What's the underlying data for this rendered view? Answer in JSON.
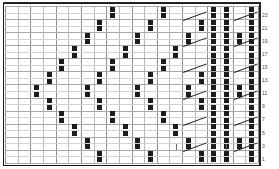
{
  "chart_data": {
    "type": "heatmap",
    "xlabel": "",
    "ylabel": "",
    "grid": true,
    "legend_position": "none",
    "columns": 20,
    "rows": 24,
    "cell_width": 12.65,
    "cell_height": 6.54,
    "row_numbers": [
      "23",
      "21",
      "19",
      "17",
      "15",
      "13",
      "11",
      "9",
      "7",
      "5",
      "3",
      "1"
    ],
    "row_number_rows": [
      1,
      3,
      5,
      7,
      9,
      11,
      13,
      15,
      17,
      19,
      21,
      23
    ],
    "categories": [
      "c1",
      "c2",
      "c3",
      "c4",
      "c5",
      "c6",
      "c7",
      "c8",
      "c9",
      "c10",
      "c11",
      "c12",
      "c13",
      "c14",
      "c15",
      "c16",
      "c17",
      "c18",
      "c19",
      "c20"
    ],
    "filled_cells": [
      [
        0,
        [
          8,
          12,
          16,
          19
        ]
      ],
      [
        1,
        [
          8,
          12,
          16,
          19
        ]
      ],
      [
        2,
        [
          7,
          11,
          15,
          19
        ]
      ],
      [
        3,
        [
          7,
          11,
          15,
          19
        ]
      ],
      [
        4,
        [
          6,
          10,
          14,
          18,
          19
        ]
      ],
      [
        5,
        [
          6,
          10,
          14,
          18,
          19
        ]
      ],
      [
        6,
        [
          5,
          9,
          13,
          17,
          19
        ]
      ],
      [
        7,
        [
          5,
          9,
          13,
          17,
          19
        ]
      ],
      [
        8,
        [
          4,
          8,
          12,
          16,
          19
        ]
      ],
      [
        9,
        [
          4,
          8,
          12,
          16,
          19
        ]
      ],
      [
        10,
        [
          3,
          7,
          11,
          15,
          19
        ]
      ],
      [
        11,
        [
          3,
          7,
          11,
          15,
          19
        ]
      ],
      [
        12,
        [
          2,
          6,
          10,
          14,
          18,
          19
        ]
      ],
      [
        13,
        [
          2,
          6,
          10,
          14,
          18,
          19
        ]
      ],
      [
        14,
        [
          3,
          7,
          11,
          15,
          19
        ]
      ],
      [
        15,
        [
          3,
          7,
          11,
          15,
          19
        ]
      ],
      [
        16,
        [
          4,
          8,
          12,
          16,
          19
        ]
      ],
      [
        17,
        [
          4,
          8,
          12,
          16,
          19
        ]
      ],
      [
        18,
        [
          5,
          9,
          13,
          17,
          19
        ]
      ],
      [
        19,
        [
          5,
          9,
          13,
          17,
          19
        ]
      ],
      [
        20,
        [
          6,
          10,
          14,
          18,
          19
        ]
      ],
      [
        21,
        [
          6,
          10,
          14,
          18,
          19
        ]
      ],
      [
        22,
        [
          7,
          11,
          15,
          19
        ]
      ],
      [
        23,
        [
          7,
          11,
          15,
          19
        ]
      ]
    ],
    "dot_columns": [
      16,
      17
    ],
    "diagonal_symbols": [
      {
        "row": 1,
        "col": 14
      },
      {
        "row": 1,
        "col": 18
      },
      {
        "row": 5,
        "col": 14
      },
      {
        "row": 5,
        "col": 18
      },
      {
        "row": 9,
        "col": 14
      },
      {
        "row": 9,
        "col": 18
      },
      {
        "row": 13,
        "col": 14
      },
      {
        "row": 13,
        "col": 18
      },
      {
        "row": 17,
        "col": 14
      },
      {
        "row": 17,
        "col": 18
      },
      {
        "row": 21,
        "col": 14
      },
      {
        "row": 21,
        "col": 18
      }
    ],
    "tick_symbols": [
      {
        "row": 21,
        "col": 13
      },
      {
        "row": 21,
        "col": 17
      }
    ],
    "colors": {
      "cell_fill": "#1c1c1c",
      "grid_minor": "#d2d2d2",
      "grid_major": "#8e8e8e",
      "frame": "#2b2b2b",
      "row_number_text": "#4a4a4a",
      "background": "#ffffff"
    }
  }
}
